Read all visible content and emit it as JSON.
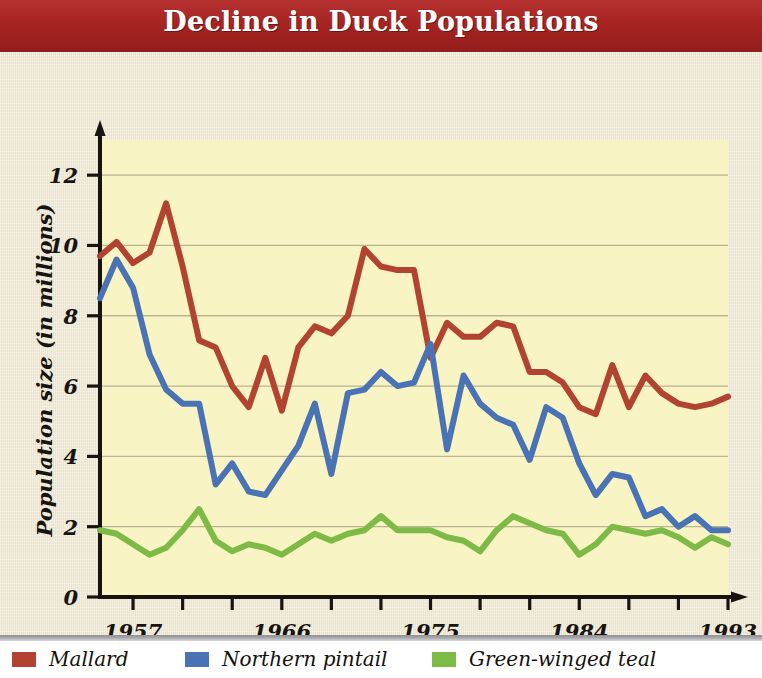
{
  "title": "Decline in Duck Populations",
  "axes": {
    "xlabel": "Year",
    "ylabel": "Population size (in millions)",
    "x_ticks": [
      "1957",
      "1966",
      "1975",
      "1984",
      "1993"
    ],
    "y_ticks": [
      "0",
      "2",
      "4",
      "6",
      "8",
      "10",
      "12"
    ]
  },
  "legend": {
    "items": [
      {
        "label": "Mallard",
        "color": "#b24331"
      },
      {
        "label": "Northern pintail",
        "color": "#4a73b5"
      },
      {
        "label": "Green-winged teal",
        "color": "#7dba46"
      }
    ]
  },
  "colors": {
    "banner": "#a92725",
    "paper": "#efe8d2",
    "plot_background": "#f9f4c3",
    "axis": "#17140f",
    "gridline": "#b9b394",
    "mallard": "#b24331",
    "northern_pintail": "#4a73b5",
    "green_winged_teal": "#7dba46"
  },
  "chart_data": {
    "type": "line",
    "title": "Decline in Duck Populations",
    "xlabel": "Year",
    "ylabel": "Population size (in millions)",
    "xlim": [
      1955,
      1993
    ],
    "ylim": [
      0,
      13
    ],
    "y_ticks": [
      0,
      2,
      4,
      6,
      8,
      10,
      12
    ],
    "x_tick_labels": [
      1957,
      1966,
      1975,
      1984,
      1993
    ],
    "x_tick_interval_years": 3,
    "grid": "horizontal",
    "legend_position": "below-figure",
    "x": [
      1955,
      1956,
      1957,
      1958,
      1959,
      1960,
      1961,
      1962,
      1963,
      1964,
      1965,
      1966,
      1967,
      1968,
      1969,
      1970,
      1971,
      1972,
      1973,
      1974,
      1975,
      1976,
      1977,
      1978,
      1979,
      1980,
      1981,
      1982,
      1983,
      1984,
      1985,
      1986,
      1987,
      1988,
      1989,
      1990,
      1991,
      1992,
      1993
    ],
    "series": [
      {
        "name": "Mallard",
        "color": "#b24331",
        "values": [
          9.7,
          10.1,
          9.5,
          9.8,
          11.2,
          9.4,
          7.3,
          7.1,
          6.0,
          5.4,
          6.8,
          5.3,
          7.1,
          7.7,
          7.5,
          8.0,
          9.9,
          9.4,
          9.3,
          9.3,
          6.8,
          7.8,
          7.4,
          7.4,
          7.8,
          7.7,
          6.4,
          6.4,
          6.1,
          5.4,
          5.2,
          6.6,
          5.4,
          6.3,
          5.8,
          5.5,
          5.4,
          5.5,
          5.7
        ]
      },
      {
        "name": "Northern pintail",
        "color": "#4a73b5",
        "values": [
          8.5,
          9.6,
          8.8,
          6.9,
          5.9,
          5.5,
          5.5,
          3.2,
          3.8,
          3.0,
          2.9,
          3.6,
          4.3,
          5.5,
          3.5,
          5.8,
          5.9,
          6.4,
          6.0,
          6.1,
          7.2,
          4.2,
          6.3,
          5.5,
          5.1,
          4.9,
          3.9,
          5.4,
          5.1,
          3.8,
          2.9,
          3.5,
          3.4,
          2.3,
          2.5,
          2.0,
          2.3,
          1.9,
          1.9
        ]
      },
      {
        "name": "Green-winged teal",
        "color": "#7dba46",
        "values": [
          1.9,
          1.8,
          1.5,
          1.2,
          1.4,
          1.9,
          2.5,
          1.6,
          1.3,
          1.5,
          1.4,
          1.2,
          1.5,
          1.8,
          1.6,
          1.8,
          1.9,
          2.3,
          1.9,
          1.9,
          1.9,
          1.7,
          1.6,
          1.3,
          1.9,
          2.3,
          2.1,
          1.9,
          1.8,
          1.2,
          1.5,
          2.0,
          1.9,
          1.8,
          1.9,
          1.7,
          1.4,
          1.7,
          1.5
        ]
      }
    ]
  }
}
